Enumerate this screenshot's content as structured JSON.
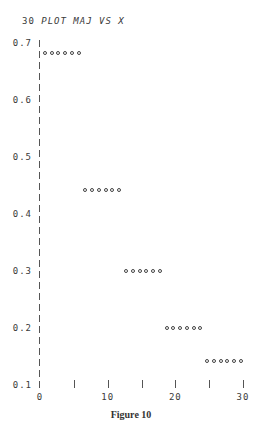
{
  "header": {
    "line_number": "30",
    "command": "PLOT MAJ VS X"
  },
  "caption": "Figure 10",
  "chart_data": {
    "type": "scatter",
    "title": "30 PLOT MAJ VS X",
    "xlabel": "X",
    "ylabel": "MAJ",
    "xlim": [
      0,
      30
    ],
    "ylim": [
      0.1,
      0.7
    ],
    "x_ticks": [
      0,
      5,
      10,
      15,
      20,
      25,
      30
    ],
    "x_tick_labels": [
      "0",
      "",
      "10",
      "",
      "20",
      "",
      "30"
    ],
    "y_ticks": [
      0.1,
      0.2,
      0.3,
      0.4,
      0.5,
      0.6,
      0.7
    ],
    "y_tick_labels": [
      "0.1",
      "0.2",
      "0.3",
      "0.4",
      "0.5",
      "0.6",
      "0.7"
    ],
    "grid": false,
    "legend": null,
    "series": [
      {
        "name": "MAJ",
        "marker": "o",
        "x": [
          1,
          2,
          3,
          4,
          5,
          6,
          7,
          8,
          9,
          10,
          11,
          12,
          13,
          14,
          15,
          16,
          17,
          18,
          19,
          20,
          21,
          22,
          23,
          24,
          25,
          26,
          27,
          28,
          29,
          30
        ],
        "y": [
          0.684,
          0.684,
          0.684,
          0.684,
          0.684,
          0.684,
          0.444,
          0.444,
          0.444,
          0.444,
          0.444,
          0.444,
          0.302,
          0.302,
          0.302,
          0.302,
          0.302,
          0.302,
          0.202,
          0.202,
          0.202,
          0.202,
          0.202,
          0.202,
          0.144,
          0.144,
          0.144,
          0.144,
          0.144,
          0.144
        ]
      }
    ]
  }
}
